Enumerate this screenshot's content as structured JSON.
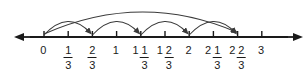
{
  "figure": {
    "line_color": "#1a1a1a",
    "arc_color": "#3a3a3a",
    "background": "#ffffff"
  },
  "number_line": {
    "start_value": 0,
    "end_value": 3,
    "step": "1/3",
    "axis_y": 37,
    "x_start": 44,
    "x_step": 24.2,
    "left_arrow_x": 22,
    "right_arrow_x": 294,
    "tick_height": 7,
    "ticks": [
      {
        "value": 0,
        "x": 44,
        "whole": "0",
        "numerator": "",
        "denominator": ""
      },
      {
        "value": 0.3333,
        "x": 68.2,
        "whole": "",
        "numerator": "1",
        "denominator": "3"
      },
      {
        "value": 0.6667,
        "x": 92.4,
        "whole": "",
        "numerator": "2",
        "denominator": "3"
      },
      {
        "value": 1,
        "x": 116.6,
        "whole": "1",
        "numerator": "",
        "denominator": ""
      },
      {
        "value": 1.3333,
        "x": 140.8,
        "whole": "1",
        "numerator": "1",
        "denominator": "3"
      },
      {
        "value": 1.6667,
        "x": 165,
        "whole": "1",
        "numerator": "2",
        "denominator": "3"
      },
      {
        "value": 2,
        "x": 189.2,
        "whole": "2",
        "numerator": "",
        "denominator": ""
      },
      {
        "value": 2.3333,
        "x": 213.4,
        "whole": "2",
        "numerator": "1",
        "denominator": "3"
      },
      {
        "value": 2.6667,
        "x": 237.6,
        "whole": "2",
        "numerator": "2",
        "denominator": "3"
      },
      {
        "value": 3,
        "x": 261.8,
        "whole": "3",
        "numerator": "",
        "denominator": ""
      }
    ],
    "label_y": 44
  },
  "arcs": {
    "jumps": [
      {
        "from_label": "0",
        "to_label": "2/3",
        "x1": 44,
        "x2": 92.4,
        "peak_y": 18,
        "arrowhead": true
      },
      {
        "from_label": "2/3",
        "to_label": "1 1/3",
        "x1": 92.4,
        "x2": 140.8,
        "peak_y": 18,
        "arrowhead": true
      },
      {
        "from_label": "1 1/3",
        "to_label": "2",
        "x1": 140.8,
        "x2": 189.2,
        "peak_y": 18,
        "arrowhead": true
      },
      {
        "from_label": "2",
        "to_label": "2 2/3",
        "x1": 189.2,
        "x2": 237.6,
        "peak_y": 18,
        "arrowhead": true
      }
    ],
    "total_jump": {
      "from_label": "0",
      "to_label": "2 2/3",
      "x1": 44,
      "x2": 237.6,
      "peak_y": 4,
      "arrowhead": true
    }
  }
}
